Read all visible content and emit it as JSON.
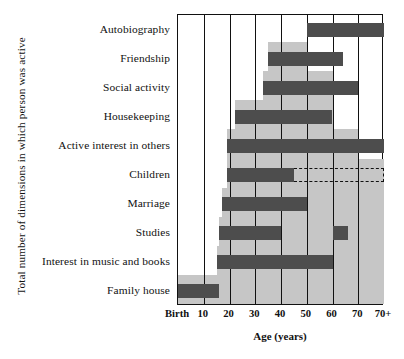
{
  "chart_data": {
    "type": "bar",
    "title": "",
    "subtitle": "",
    "xlabel": "Age (years)",
    "ylabel": "Total number of dimensions in which person was active",
    "grid": true,
    "legend": null,
    "orientation": "horizontal",
    "xlim": [
      0,
      80
    ],
    "xticks": [
      0,
      10,
      20,
      30,
      40,
      50,
      60,
      70,
      80
    ],
    "xticklabels": [
      "Birth",
      "10",
      "20",
      "30",
      "40",
      "50",
      "60",
      "70",
      "70+"
    ],
    "categories": [
      "Autobiography",
      "Friendship",
      "Social activity",
      "Housekeeping",
      "Active interest in others",
      "Children",
      "Marriage",
      "Studies",
      "Interest in music and books",
      "Family house"
    ],
    "bars": [
      {
        "category": "Autobiography",
        "start": 50,
        "end": 80,
        "style": "solid"
      },
      {
        "category": "Friendship",
        "start": 35,
        "end": 64,
        "style": "solid"
      },
      {
        "category": "Social activity",
        "start": 33,
        "end": 70,
        "style": "solid"
      },
      {
        "category": "Housekeeping",
        "start": 22,
        "end": 60,
        "style": "solid"
      },
      {
        "category": "Active interest in others",
        "start": 19,
        "end": 80,
        "style": "solid"
      },
      {
        "category": "Children",
        "start": 19,
        "end": 45,
        "style": "solid"
      },
      {
        "category": "Children",
        "start": 45,
        "end": 80,
        "style": "dashed"
      },
      {
        "category": "Marriage",
        "start": 17,
        "end": 50,
        "style": "solid"
      },
      {
        "category": "Studies",
        "start": 16,
        "end": 40,
        "style": "solid"
      },
      {
        "category": "Studies",
        "start": 60,
        "end": 66,
        "style": "solid"
      },
      {
        "category": "Interest in music and books",
        "start": 15,
        "end": 60,
        "style": "solid"
      },
      {
        "category": "Family house",
        "start": 0,
        "end": 16,
        "style": "solid"
      }
    ],
    "cumulative_background": {
      "description": "Shaded staircase showing total number of dimensions active at each age",
      "steps": [
        {
          "start": 0,
          "end": 15,
          "level": 1
        },
        {
          "start": 15,
          "end": 16,
          "level": 2
        },
        {
          "start": 16,
          "end": 17,
          "level": 3
        },
        {
          "start": 17,
          "end": 19,
          "level": 4
        },
        {
          "start": 19,
          "end": 22,
          "level": 6
        },
        {
          "start": 22,
          "end": 33,
          "level": 7
        },
        {
          "start": 33,
          "end": 35,
          "level": 8
        },
        {
          "start": 35,
          "end": 50,
          "level": 9
        },
        {
          "start": 50,
          "end": 60,
          "level": 8
        },
        {
          "start": 60,
          "end": 70,
          "level": 6
        },
        {
          "start": 70,
          "end": 80,
          "level": 5
        }
      ],
      "max_level": 10
    },
    "colors": {
      "bar": "#4d4d4d",
      "background_step": "#c6c6c6",
      "axis": "#111111",
      "page": "#ffffff"
    }
  }
}
